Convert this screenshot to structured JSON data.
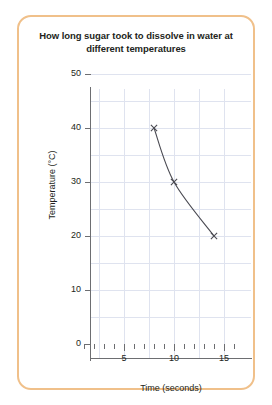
{
  "card": {
    "border_color": "#f0c08a"
  },
  "chart_data": {
    "type": "line",
    "title": "How long sugar took to dissolve in water at different temperatures",
    "xlabel": "Time (seconds)",
    "ylabel": "Temperature (°C)",
    "xlim": [
      0,
      16
    ],
    "ylim": [
      0,
      50
    ],
    "grid": true,
    "legend": "none",
    "marker": "x",
    "line_color": "#4a4a52",
    "grid_color": "#dfe3ef",
    "axis_color": "#6d6e71",
    "x": [
      8,
      10,
      14
    ],
    "values": [
      40,
      30,
      20
    ],
    "points": [
      {
        "x": 8,
        "y": 40
      },
      {
        "x": 10,
        "y": 30
      },
      {
        "x": 14,
        "y": 20
      }
    ],
    "xticks": [
      0,
      1,
      2,
      3,
      4,
      5,
      6,
      7,
      8,
      9,
      10,
      11,
      12,
      13,
      14,
      15,
      16
    ],
    "xtick_labels": [
      {
        "value": 5,
        "label": "5"
      },
      {
        "value": 10,
        "label": "10"
      },
      {
        "value": 15,
        "label": "15"
      }
    ],
    "yticks": [
      0,
      10,
      20,
      30,
      40,
      50
    ],
    "ytick_labels": [
      "0",
      "10",
      "20",
      "30",
      "40",
      "50"
    ],
    "x_gridlines": [
      2.5,
      5,
      7.5,
      10,
      12.5,
      15
    ],
    "y_gridlines": [
      5,
      10,
      15,
      20,
      25,
      30,
      35,
      40,
      45,
      50
    ]
  }
}
